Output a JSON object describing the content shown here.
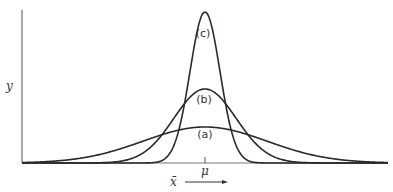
{
  "figure": {
    "y_axis_label": "y",
    "mean_label": "μ",
    "x_axis_label": "x̄",
    "curves": [
      {
        "id": "a",
        "label": "(a)",
        "peak_y": 127,
        "sigma": 62,
        "label_pos": [
          205,
          138
        ]
      },
      {
        "id": "b",
        "label": "(b)",
        "peak_y": 89,
        "sigma": 31,
        "label_pos": [
          204,
          103
        ]
      },
      {
        "id": "c",
        "label": "(c)",
        "peak_y": 12,
        "sigma": 15,
        "label_pos": [
          203,
          37
        ]
      }
    ],
    "colors": {
      "stroke": "#2a2a2a",
      "axis": "#555555"
    }
  }
}
